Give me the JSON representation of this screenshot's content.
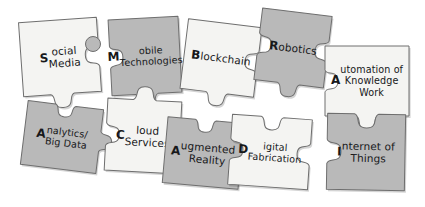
{
  "diagram": {
    "type": "jigsaw-puzzle-diagram",
    "background_color": "#ffffff",
    "piece_fill_light": "#f4f4f2",
    "piece_fill_dark": "#b9b9b9",
    "piece_stroke": "#6e6e6e",
    "text_color": "#17181a"
  },
  "pieces": [
    {
      "id": "social-media",
      "label": "Social\nMedia",
      "lead_letter": "S",
      "rest": "ocial\nMedia",
      "shade": "light",
      "fill": "#f4f4f2",
      "x": 21,
      "y": 20,
      "w": 78,
      "h": 74,
      "rotation": -4,
      "edges": {
        "top": "flat",
        "right": "socket",
        "bottom": "knob",
        "left": "flat"
      }
    },
    {
      "id": "mobile-technologies",
      "label": "Mobile\nTechnologies",
      "lead_letter": "M",
      "rest": "obile\nTechnologies",
      "shade": "dark",
      "fill": "#b9b9b9",
      "x": 110,
      "y": 18,
      "w": 70,
      "h": 76,
      "rotation": -3,
      "edges": {
        "top": "flat",
        "right": "flat",
        "bottom": "knob",
        "left": "socket"
      }
    },
    {
      "id": "blockchain",
      "label": "Blockchain",
      "lead_letter": "B",
      "rest": "lockchain",
      "shade": "light",
      "fill": "#f4f4f2",
      "x": 184,
      "y": 23,
      "w": 74,
      "h": 70,
      "rotation": 7,
      "edges": {
        "top": "flat",
        "right": "socket",
        "bottom": "knob",
        "left": "flat"
      }
    },
    {
      "id": "robotics",
      "label": "Robotics",
      "lead_letter": "R",
      "rest": "obotics",
      "shade": "dark",
      "fill": "#b9b9b9",
      "x": 258,
      "y": 12,
      "w": 70,
      "h": 72,
      "rotation": 7,
      "edges": {
        "top": "flat",
        "right": "socket",
        "bottom": "knob",
        "left": "socket"
      }
    },
    {
      "id": "automation-of-knowledge-work",
      "label": "Automation of\nKnowledge\nWork",
      "lead_letter": "A",
      "rest": "utomation of\nKnowledge\nWork",
      "shade": "light",
      "fill": "#f4f4f2",
      "x": 325,
      "y": 46,
      "w": 84,
      "h": 70,
      "rotation": 0,
      "edges": {
        "top": "flat",
        "right": "flat",
        "bottom": "knob",
        "left": "socket"
      }
    },
    {
      "id": "analytics-big-data",
      "label": "Analytics/\nBig Data",
      "lead_letter": "A",
      "rest": "nalytics/\nBig Data",
      "shade": "dark",
      "fill": "#b9b9b9",
      "x": 24,
      "y": 105,
      "w": 76,
      "h": 64,
      "rotation": 7,
      "edges": {
        "top": "socket",
        "right": "knob",
        "bottom": "flat",
        "left": "flat"
      }
    },
    {
      "id": "cloud-services",
      "label": "Cloud\nServices",
      "lead_letter": "C",
      "rest": "loud\nServices",
      "shade": "light",
      "fill": "#f4f4f2",
      "x": 106,
      "y": 100,
      "w": 74,
      "h": 72,
      "rotation": 3,
      "edges": {
        "top": "knob",
        "right": "flat",
        "bottom": "flat",
        "left": "socket"
      }
    },
    {
      "id": "augmented-reality",
      "label": "Augmented\nReality",
      "lead_letter": "A",
      "rest": "ugmented\nReality",
      "shade": "dark",
      "fill": "#b9b9b9",
      "x": 165,
      "y": 120,
      "w": 76,
      "h": 66,
      "rotation": 5,
      "edges": {
        "top": "socket",
        "right": "knob",
        "bottom": "flat",
        "left": "flat"
      }
    },
    {
      "id": "digital-fabrication",
      "label": "Digital\nFabrication",
      "lead_letter": "D",
      "rest": "igital\nFabrication",
      "shade": "light",
      "fill": "#f4f4f2",
      "x": 230,
      "y": 117,
      "w": 80,
      "h": 70,
      "rotation": 4,
      "edges": {
        "top": "socket",
        "right": "socket",
        "bottom": "flat",
        "left": "socket"
      }
    },
    {
      "id": "internet-of-things",
      "label": "Internet of\nThings",
      "lead_letter": "I",
      "rest": "nternet of\nThings",
      "shade": "dark",
      "fill": "#b9b9b9",
      "x": 327,
      "y": 114,
      "w": 78,
      "h": 76,
      "rotation": 1,
      "edges": {
        "top": "socket",
        "right": "flat",
        "bottom": "flat",
        "left": "socket"
      }
    }
  ],
  "connectors": [
    {
      "id": "connector-social-mobile",
      "x": 93,
      "y": 44,
      "r": 8,
      "fill": "#b9b9b9"
    }
  ]
}
